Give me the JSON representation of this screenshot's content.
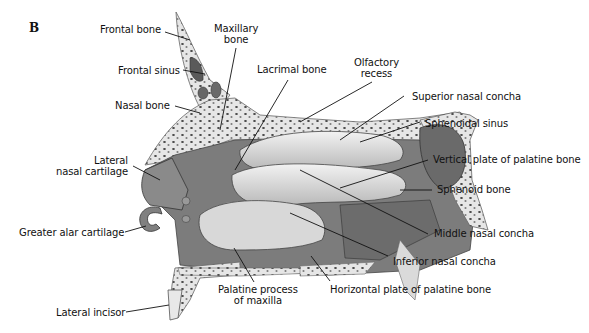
{
  "figure": {
    "panel_letter": "B",
    "type": "anatomical illustration"
  },
  "labels": {
    "frontal_bone": "Frontal bone",
    "maxillary_bone_1": "Maxillary",
    "maxillary_bone_2": "bone",
    "frontal_sinus": "Frontal sinus",
    "lacrimal_bone": "Lacrimal bone",
    "olfactory_recess_1": "Olfactory",
    "olfactory_recess_2": "recess",
    "nasal_bone": "Nasal bone",
    "superior_nasal_concha": "Superior nasal concha",
    "sphenoidal_sinus": "Sphenoidal sinus",
    "lateral_nasal_cartilage_1": "Lateral",
    "lateral_nasal_cartilage_2": "nasal cartilage",
    "vertical_plate_palatine": "Vertical plate of palatine bone",
    "sphenoid_bone": "Sphenoid bone",
    "greater_alar_cartilage": "Greater alar cartilage",
    "middle_nasal_concha": "Middle nasal concha",
    "inferior_nasal_concha": "Inferior nasal concha",
    "palatine_process_1": "Palatine process",
    "palatine_process_2": "of maxilla",
    "horizontal_plate_palatine": "Horizontal plate of palatine bone",
    "lateral_incisor": "Lateral incisor"
  },
  "colors": {
    "bone": "#e9e9e9",
    "cavity_dark": "#6e6e6e",
    "cavity_mid": "#8c8c8c",
    "concha": "#d6d6d6",
    "sinus": "#7a7a7a",
    "text": "#111111",
    "leader": "#111111"
  }
}
